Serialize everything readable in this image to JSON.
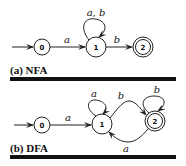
{
  "panels": [
    {
      "caption": "(a) NFA",
      "states": [
        {
          "id": "0",
          "label": "0",
          "initial": true,
          "accepting": false
        },
        {
          "id": "1",
          "label": "1",
          "initial": false,
          "accepting": false
        },
        {
          "id": "2",
          "label": "2",
          "initial": false,
          "accepting": true
        }
      ],
      "transitions": [
        {
          "from": "0",
          "to": "1",
          "label": "a"
        },
        {
          "from": "1",
          "to": "1",
          "label": "a, b"
        },
        {
          "from": "1",
          "to": "2",
          "label": "b"
        }
      ]
    },
    {
      "caption": "(b) DFA",
      "states": [
        {
          "id": "0",
          "label": "0",
          "initial": true,
          "accepting": false
        },
        {
          "id": "1",
          "label": "1",
          "initial": false,
          "accepting": false
        },
        {
          "id": "2",
          "label": "2",
          "initial": false,
          "accepting": true
        }
      ],
      "transitions": [
        {
          "from": "0",
          "to": "1",
          "label": "a"
        },
        {
          "from": "1",
          "to": "1",
          "label": "a"
        },
        {
          "from": "1",
          "to": "2",
          "label": "b"
        },
        {
          "from": "2",
          "to": "2",
          "label": "b"
        },
        {
          "from": "2",
          "to": "1",
          "label": "a"
        }
      ]
    }
  ]
}
